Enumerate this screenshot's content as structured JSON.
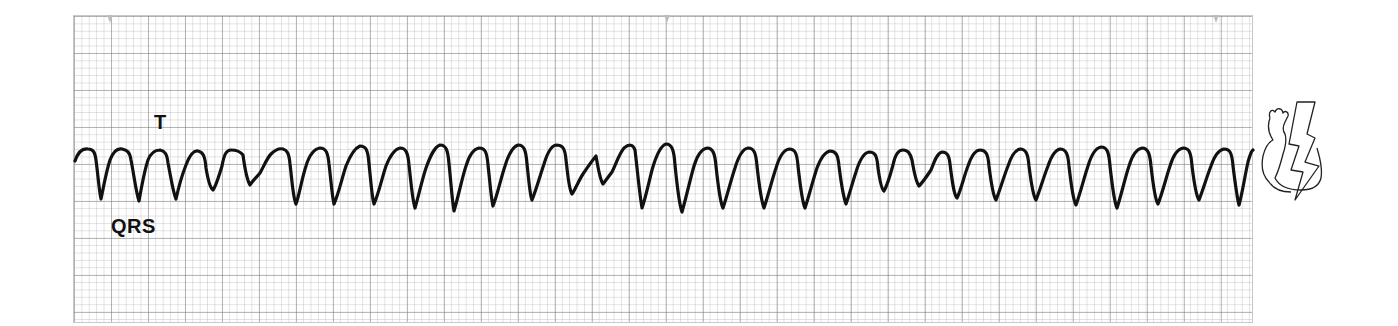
{
  "figure": {
    "title": "",
    "rhythm_strip": {
      "paper_color": "#ffffff",
      "grid_major_color": "#9a9a9a",
      "grid_minor_color": "#c4c4c4",
      "trace_color": "#111111",
      "markers": [
        "tick",
        "tick",
        "tick"
      ]
    },
    "annotations": {
      "t_wave_label": "T",
      "qrs_label": "QRS"
    },
    "icons": {
      "heart": "heart-outline-icon",
      "shock": "lightning-bolt-icon"
    }
  }
}
